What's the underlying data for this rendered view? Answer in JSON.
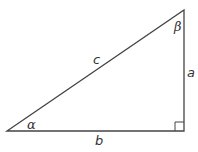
{
  "diagram": {
    "type": "right-triangle",
    "stroke_color": "#444444",
    "vertices": {
      "left": [
        7,
        131
      ],
      "top_right": [
        184,
        10
      ],
      "bottom_right": [
        184,
        131
      ]
    },
    "labels": {
      "hypotenuse": "c",
      "vertical_side": "a",
      "horizontal_side": "b",
      "angle_left": "α",
      "angle_top": "β"
    },
    "right_angle_marker": true
  }
}
